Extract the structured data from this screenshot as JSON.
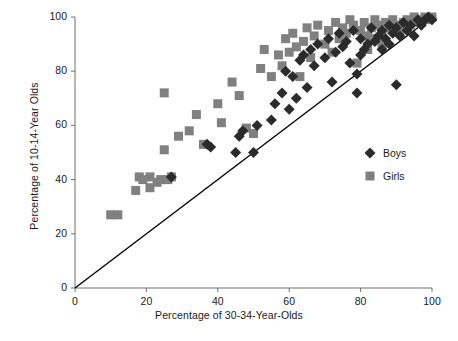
{
  "chart_data": {
    "type": "scatter",
    "title": "",
    "xlabel": "Percentage of 30-34-Year-Olds",
    "ylabel": "Percentage of 10-14-Year Olds",
    "xlim": [
      0,
      100
    ],
    "ylim": [
      0,
      100
    ],
    "xticks": [
      0,
      20,
      40,
      60,
      80,
      100
    ],
    "yticks": [
      0,
      20,
      40,
      60,
      80,
      100
    ],
    "grid": false,
    "legend_position": "right-middle",
    "reference_line": {
      "name": "identity-line",
      "from": [
        0,
        0
      ],
      "to": [
        100,
        100
      ],
      "color": "#000000"
    },
    "series": [
      {
        "name": "Boys",
        "marker": "diamond",
        "color": "#2b2b2b",
        "points": [
          [
            27,
            41
          ],
          [
            37,
            53
          ],
          [
            38,
            52
          ],
          [
            45,
            50
          ],
          [
            46,
            56
          ],
          [
            47,
            58
          ],
          [
            50,
            50
          ],
          [
            51,
            60
          ],
          [
            55,
            62
          ],
          [
            56,
            68
          ],
          [
            58,
            72
          ],
          [
            59,
            80
          ],
          [
            60,
            66
          ],
          [
            61,
            78
          ],
          [
            62,
            70
          ],
          [
            63,
            84
          ],
          [
            64,
            86
          ],
          [
            65,
            74
          ],
          [
            66,
            88
          ],
          [
            67,
            82
          ],
          [
            68,
            90
          ],
          [
            70,
            85
          ],
          [
            71,
            92
          ],
          [
            72,
            76
          ],
          [
            73,
            87
          ],
          [
            74,
            94
          ],
          [
            75,
            89
          ],
          [
            76,
            91
          ],
          [
            77,
            83
          ],
          [
            78,
            95
          ],
          [
            79,
            79
          ],
          [
            79,
            72
          ],
          [
            80,
            86
          ],
          [
            80,
            92
          ],
          [
            81,
            88
          ],
          [
            82,
            90
          ],
          [
            83,
            96
          ],
          [
            84,
            91
          ],
          [
            85,
            93
          ],
          [
            86,
            88
          ],
          [
            86,
            95
          ],
          [
            87,
            92
          ],
          [
            88,
            97
          ],
          [
            88,
            90
          ],
          [
            89,
            94
          ],
          [
            90,
            96
          ],
          [
            90,
            75
          ],
          [
            91,
            93
          ],
          [
            92,
            98
          ],
          [
            93,
            95
          ],
          [
            94,
            97
          ],
          [
            95,
            93
          ],
          [
            96,
            99
          ],
          [
            97,
            97
          ],
          [
            98,
            99
          ],
          [
            99,
            100
          ],
          [
            100,
            99
          ]
        ]
      },
      {
        "name": "Girls",
        "marker": "square",
        "color": "#808080",
        "points": [
          [
            10,
            27
          ],
          [
            12,
            27
          ],
          [
            17,
            36
          ],
          [
            18,
            41
          ],
          [
            19,
            40
          ],
          [
            21,
            41
          ],
          [
            21,
            37
          ],
          [
            23,
            39
          ],
          [
            24,
            40
          ],
          [
            25,
            72
          ],
          [
            26,
            40
          ],
          [
            27,
            41
          ],
          [
            25,
            51
          ],
          [
            29,
            56
          ],
          [
            32,
            58
          ],
          [
            34,
            64
          ],
          [
            36,
            53
          ],
          [
            40,
            68
          ],
          [
            41,
            61
          ],
          [
            44,
            76
          ],
          [
            46,
            71
          ],
          [
            48,
            59
          ],
          [
            50,
            57
          ],
          [
            52,
            81
          ],
          [
            53,
            88
          ],
          [
            55,
            78
          ],
          [
            57,
            86
          ],
          [
            58,
            82
          ],
          [
            59,
            92
          ],
          [
            60,
            87
          ],
          [
            61,
            94
          ],
          [
            62,
            89
          ],
          [
            63,
            78
          ],
          [
            64,
            91
          ],
          [
            65,
            96
          ],
          [
            66,
            85
          ],
          [
            67,
            93
          ],
          [
            68,
            97
          ],
          [
            70,
            90
          ],
          [
            71,
            95
          ],
          [
            72,
            87
          ],
          [
            73,
            98
          ],
          [
            74,
            92
          ],
          [
            75,
            96
          ],
          [
            76,
            94
          ],
          [
            77,
            99
          ],
          [
            78,
            97
          ],
          [
            79,
            83
          ],
          [
            80,
            95
          ],
          [
            81,
            98
          ],
          [
            82,
            93
          ],
          [
            83,
            96
          ],
          [
            84,
            99
          ],
          [
            85,
            97
          ],
          [
            86,
            94
          ],
          [
            87,
            98
          ],
          [
            88,
            96
          ],
          [
            89,
            99
          ],
          [
            90,
            97
          ],
          [
            91,
            95
          ],
          [
            92,
            98
          ],
          [
            93,
            99
          ],
          [
            94,
            97
          ],
          [
            95,
            100
          ],
          [
            96,
            98
          ],
          [
            97,
            99
          ],
          [
            98,
            100
          ],
          [
            99,
            99
          ],
          [
            100,
            100
          ],
          [
            82,
            88
          ],
          [
            84,
            92
          ],
          [
            86,
            90
          ]
        ]
      }
    ]
  },
  "legend": {
    "entries": [
      {
        "label": "Boys",
        "marker": "diamond",
        "color": "#2b2b2b"
      },
      {
        "label": "Girls",
        "marker": "square",
        "color": "#808080"
      }
    ]
  },
  "axes": {
    "x_tick_labels": [
      "0",
      "20",
      "40",
      "60",
      "80",
      "100"
    ],
    "y_tick_labels": [
      "0",
      "20",
      "40",
      "60",
      "80",
      "100"
    ]
  }
}
